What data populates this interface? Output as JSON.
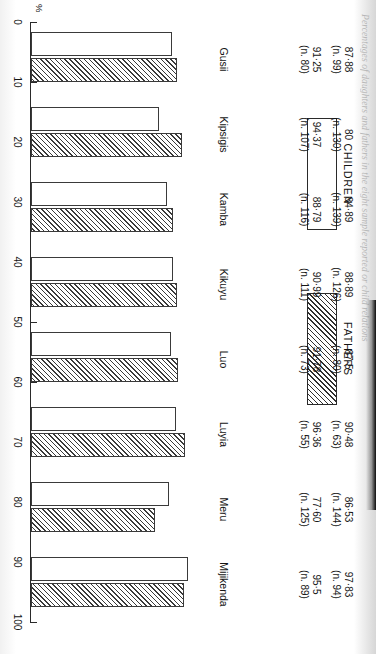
{
  "caption": "Percentages of daughters and fathers in the eight sample reported or child relations",
  "legend": {
    "children_label": "CHILDREN",
    "fathers_label": "FATHERS"
  },
  "axis": {
    "unit_label": "%",
    "ticks": [
      100,
      90,
      80,
      70,
      60,
      50,
      40,
      30,
      20,
      10,
      0
    ],
    "tick_labels": [
      "100",
      "90",
      "80",
      "70",
      "60",
      "50",
      "40",
      "30",
      "20",
      "10",
      "0"
    ]
  },
  "groups": [
    {
      "name": "Gusii",
      "children_value": "87·88",
      "children_n": "(n. 99)",
      "fathers_value": "91·25",
      "fathers_n": "(n. 80)"
    },
    {
      "name": "Kipsigis",
      "children_value": "80",
      "children_n": "(n. 130)",
      "fathers_value": "94·37",
      "fathers_n": "(n. 107)"
    },
    {
      "name": "Kamba",
      "children_value": "84·89",
      "children_n": "(n. 139)",
      "fathers_value": "88·79",
      "fathers_n": "(n. 116)"
    },
    {
      "name": "Kikuyu",
      "children_value": "88·89",
      "children_n": "(n. 126)",
      "fathers_value": "90·99",
      "fathers_n": "(n. 111)"
    },
    {
      "name": "Luo",
      "children_value": "87·5",
      "children_n": "(n. 80)",
      "fathers_value": "91·78",
      "fathers_n": "(n. 73)"
    },
    {
      "name": "Luyia",
      "children_value": "90·48",
      "children_n": "(n. 63)",
      "fathers_value": "96·36",
      "fathers_n": "(n. 55)"
    },
    {
      "name": "Meru",
      "children_value": "86·53",
      "children_n": "(n. 144)",
      "fathers_value": "77·60",
      "fathers_n": "(n. 125)"
    },
    {
      "name": "Mijikenda",
      "children_value": "97·83",
      "children_n": "(n. 94)",
      "fathers_value": "95·5",
      "fathers_n": "(n. 89)"
    }
  ],
  "chart_data": {
    "type": "bar",
    "title": "",
    "xlabel": "",
    "ylabel": "%",
    "ylim": [
      0,
      100
    ],
    "grid": false,
    "legend_position": "top",
    "orientation": "vertical",
    "categories": [
      "Gusii",
      "Kipsigis",
      "Kamba",
      "Kikuyu",
      "Luo",
      "Luyia",
      "Meru",
      "Mijikenda"
    ],
    "series": [
      {
        "name": "CHILDREN",
        "values": [
          87.88,
          80,
          84.89,
          88.89,
          87.5,
          90.48,
          86.53,
          97.83
        ],
        "sample_sizes": [
          99,
          130,
          139,
          126,
          80,
          63,
          144,
          94
        ]
      },
      {
        "name": "FATHERS",
        "values": [
          91.25,
          94.37,
          88.79,
          90.99,
          91.78,
          96.36,
          77.6,
          95.5
        ],
        "sample_sizes": [
          80,
          107,
          116,
          111,
          73,
          55,
          125,
          89
        ]
      }
    ]
  }
}
